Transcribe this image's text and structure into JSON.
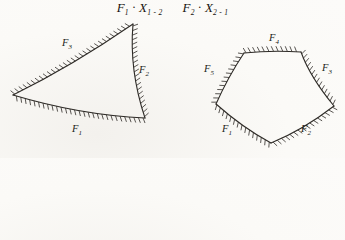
{
  "page": {
    "background": "#fbfaf7"
  },
  "title": {
    "expr1": {
      "base": "F",
      "base_sub": "1",
      "op": "·",
      "var": "X",
      "var_sub": "1 - 2"
    },
    "expr2": {
      "base": "F",
      "base_sub": "2",
      "op": "·",
      "var": "X",
      "var_sub": "2 - 1"
    }
  },
  "diagram": {
    "width": 345,
    "height": 158,
    "stroke": "#2e2b27",
    "edge_width": 1.1,
    "hatch": {
      "length": 5.5,
      "spacing": 4.6,
      "lean": 0.45,
      "width": 0.8
    },
    "label_style": {
      "size": 10.5,
      "sub_size": 7,
      "sub_dy": 2.5,
      "color": "#211d18"
    },
    "shapes": [
      {
        "name": "curvilinear-triangle",
        "edges": [
          {
            "label": "F",
            "sub": "3",
            "from": [
              13,
              95
            ],
            "ctrl": [
              72,
              66
            ],
            "to": [
              133,
              24
            ],
            "label_pos": [
              67,
              46
            ]
          },
          {
            "label": "F",
            "sub": "2",
            "from": [
              133,
              24
            ],
            "ctrl": [
              129,
              70
            ],
            "to": [
              145,
              118
            ],
            "label_pos": [
              144,
              73
            ]
          },
          {
            "label": "F",
            "sub": "1",
            "from": [
              145,
              118
            ],
            "ctrl": [
              80,
              115
            ],
            "to": [
              13,
              95
            ],
            "label_pos": [
              77,
              132
            ]
          }
        ]
      },
      {
        "name": "curvilinear-pentagon",
        "edges": [
          {
            "label": "F",
            "sub": "4",
            "from": [
              244,
              53
            ],
            "ctrl": [
              272,
              50
            ],
            "to": [
              301,
              52
            ],
            "label_pos": [
              274,
              41
            ]
          },
          {
            "label": "F",
            "sub": "3",
            "from": [
              301,
              52
            ],
            "ctrl": [
              310,
              77
            ],
            "to": [
              334,
              106
            ],
            "label_pos": [
              327,
              71
            ]
          },
          {
            "label": "F",
            "sub": "2",
            "from": [
              334,
              106
            ],
            "ctrl": [
              303,
              130
            ],
            "to": [
              271,
              143
            ],
            "label_pos": [
              306,
              132
            ]
          },
          {
            "label": "F",
            "sub": "1",
            "from": [
              271,
              143
            ],
            "ctrl": [
              243,
              128
            ],
            "to": [
              216,
              104
            ],
            "label_pos": [
              227,
              132
            ]
          },
          {
            "label": "F",
            "sub": "5",
            "from": [
              216,
              104
            ],
            "ctrl": [
              228,
              77
            ],
            "to": [
              244,
              53
            ],
            "label_pos": [
              209,
              72
            ]
          }
        ]
      }
    ]
  }
}
